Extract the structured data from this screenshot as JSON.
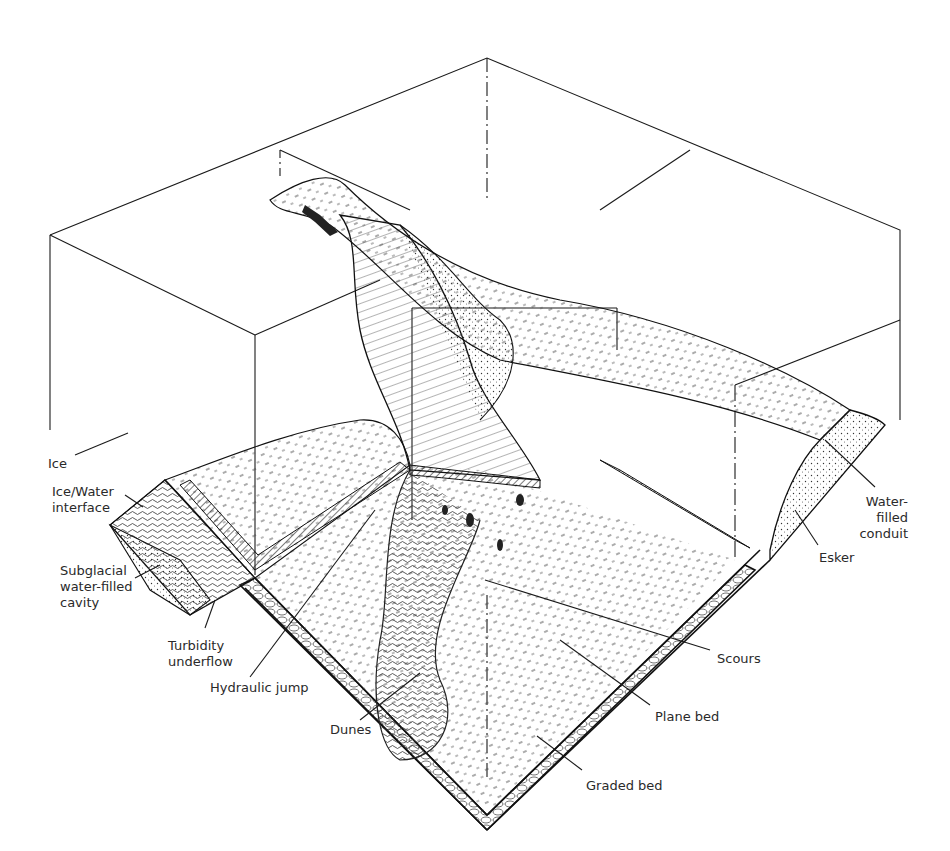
{
  "figure": {
    "type": "block-diagram",
    "colors": {
      "ink": "#1a1a1a",
      "background": "#ffffff",
      "label": "#2a2a2a"
    }
  },
  "labels": {
    "ice": "Ice",
    "ice_water_interface": "Ice/Water\ninterface",
    "subglacial_cavity": "Subglacial\nwater-filled\ncavity",
    "turbidity_underflow": "Turbidity\nunderflow",
    "hydraulic_jump": "Hydraulic jump",
    "dunes": "Dunes",
    "scours": "Scours",
    "plane_bed": "Plane bed",
    "graded_bed": "Graded bed",
    "esker": "Esker",
    "water_filled_conduit": "Water-\nfilled\nconduit"
  }
}
